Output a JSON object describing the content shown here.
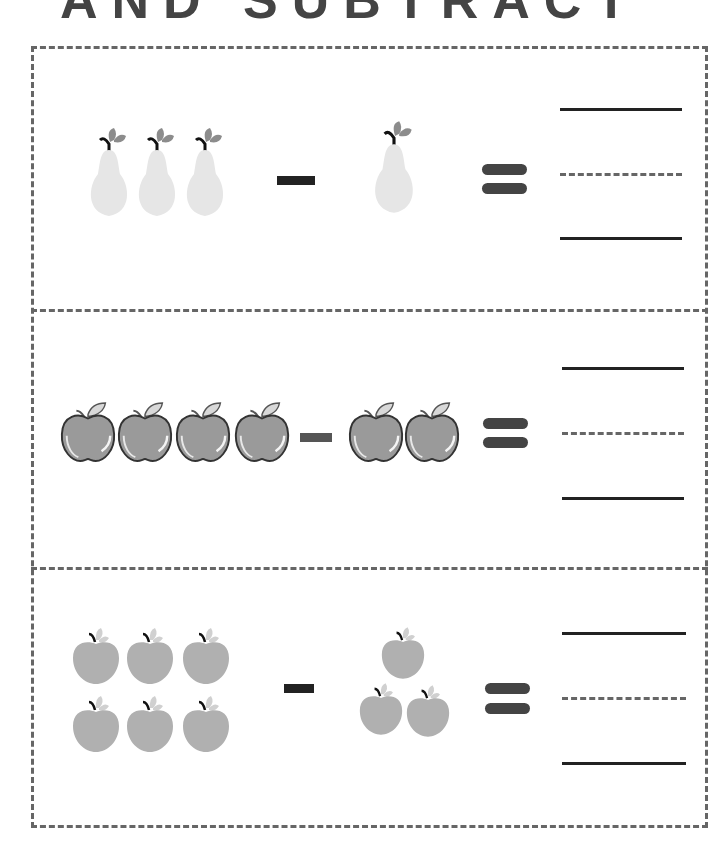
{
  "title": "AND SUBTRACT",
  "colors": {
    "frame": "#666666",
    "minus": "#222222",
    "equals": "#444444",
    "pear": "#e6e6e6",
    "pear_leaf": "#8c8c8c",
    "glossy_apple": "#9a9a9a",
    "plain_apple": "#b0b0b0",
    "answer_line": "#222222"
  },
  "rows": [
    {
      "fruit": "pear",
      "left_count": 3,
      "operator": "minus",
      "right_count": 1,
      "equals": "equals",
      "answer_lines": [
        "solid",
        "dashed",
        "solid"
      ]
    },
    {
      "fruit": "glossy-apple",
      "left_count": 4,
      "operator": "minus",
      "right_count": 2,
      "equals": "equals",
      "answer_lines": [
        "solid",
        "dashed",
        "solid"
      ]
    },
    {
      "fruit": "apple",
      "left_count": 6,
      "operator": "minus",
      "right_count": 3,
      "equals": "equals",
      "answer_lines": [
        "solid",
        "dashed",
        "solid"
      ]
    }
  ]
}
